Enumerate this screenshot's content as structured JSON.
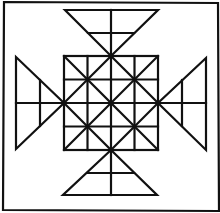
{
  "diagram": {
    "stroke_color": "#111111",
    "background": "#ffffff",
    "frame": {
      "x1": 3,
      "y1": 2,
      "x2": 218,
      "y2": 211
    },
    "center_square": {
      "x": 64,
      "y": 56,
      "size": 94,
      "divisions": 4
    },
    "triangles": [
      {
        "side": "top",
        "apex": [
          111,
          56
        ],
        "base": [
          [
            65,
            10
          ],
          [
            158,
            10
          ]
        ],
        "mid_line_y": 33
      },
      {
        "side": "bottom",
        "apex": [
          111,
          150
        ],
        "base": [
          [
            63,
            195
          ],
          [
            157,
            195
          ]
        ],
        "mid_line_y": 173
      },
      {
        "side": "left",
        "apex": [
          64,
          103
        ],
        "base": [
          [
            16,
            57
          ],
          [
            16,
            149
          ]
        ],
        "mid_line_x": 40
      },
      {
        "side": "right",
        "apex": [
          158,
          103
        ],
        "base": [
          [
            206,
            58
          ],
          [
            206,
            150
          ]
        ],
        "mid_line_x": 182
      }
    ]
  }
}
